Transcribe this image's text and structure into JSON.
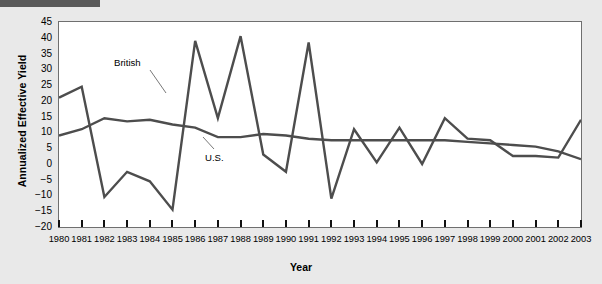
{
  "chart_data": {
    "type": "line",
    "title": "",
    "xlabel": "Year",
    "ylabel": "Annualized Effective Yield",
    "grid": false,
    "legend_position": "inline-annotations",
    "x": [
      1980,
      1981,
      1982,
      1983,
      1984,
      1985,
      1986,
      1987,
      1988,
      1989,
      1990,
      1991,
      1992,
      1993,
      1994,
      1995,
      1996,
      1997,
      1998,
      1999,
      2000,
      2001,
      2002,
      2003
    ],
    "categories": [
      "1980",
      "1981",
      "1982",
      "1983",
      "1984",
      "1985",
      "1986",
      "1987",
      "1988",
      "1989",
      "1990",
      "1991",
      "1992",
      "1993",
      "1994",
      "1995",
      "1996",
      "1997",
      "1998",
      "1999",
      "2000",
      "2001",
      "2002",
      "2003"
    ],
    "xlim": [
      1980,
      2003
    ],
    "ylim": [
      -20,
      45
    ],
    "ytick_values": [
      45,
      40,
      35,
      30,
      25,
      20,
      15,
      10,
      5,
      0,
      -5,
      -10,
      -15,
      -20
    ],
    "ytick_labels": [
      "45",
      "40",
      "35",
      "30",
      "25",
      "20",
      "15",
      "10",
      "5",
      "0",
      "−5",
      "−10",
      "−15",
      "−20"
    ],
    "series": [
      {
        "name": "British",
        "label": "British",
        "color": "#4d4d4d",
        "values": [
          21,
          24.5,
          -10.5,
          -2.5,
          -5.5,
          -14.5,
          39,
          14.5,
          40.5,
          3,
          -2.5,
          38.5,
          -11,
          11,
          0.5,
          11.5,
          0,
          14.5,
          8,
          7.5,
          2.5,
          2.5,
          2,
          14
        ]
      },
      {
        "name": "U.S.",
        "label": "U.S.",
        "color": "#4d4d4d",
        "values": [
          9,
          11,
          14.5,
          13.5,
          14,
          12.5,
          11.5,
          8.5,
          8.5,
          9.5,
          9,
          8,
          7.5,
          7.5,
          7.5,
          7.5,
          7.5,
          7.5,
          7,
          6.5,
          6,
          5.5,
          4,
          1.5
        ]
      }
    ],
    "annotations": [
      {
        "text": "British",
        "x_px": 114,
        "y_px": 63
      },
      {
        "text": "U.S.",
        "x_px": 205,
        "y_px": 158
      }
    ]
  },
  "ylabel_text": "Annualized Effective Yield",
  "xlabel_text": "Year"
}
